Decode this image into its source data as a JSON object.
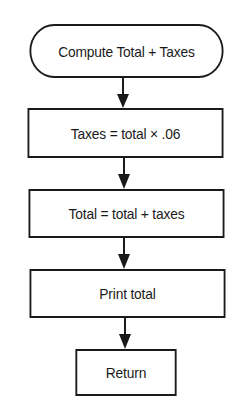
{
  "diagram": {
    "type": "flowchart",
    "nodes": [
      {
        "id": "start",
        "shape": "terminator",
        "label": "Compute Total + Taxes"
      },
      {
        "id": "taxes",
        "shape": "process",
        "label": "Taxes = total × .06"
      },
      {
        "id": "total",
        "shape": "process",
        "label": "Total = total + taxes"
      },
      {
        "id": "print",
        "shape": "process",
        "label": "Print total"
      },
      {
        "id": "return",
        "shape": "process",
        "label": "Return"
      }
    ],
    "edges": [
      {
        "from": "start",
        "to": "taxes"
      },
      {
        "from": "taxes",
        "to": "total"
      },
      {
        "from": "total",
        "to": "print"
      },
      {
        "from": "print",
        "to": "return"
      }
    ],
    "colors": {
      "stroke": "#1a1a1a",
      "background": "#ffffff"
    }
  }
}
